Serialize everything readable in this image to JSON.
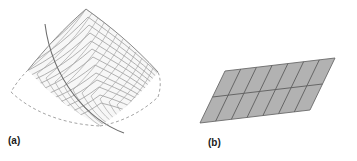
{
  "figure": {
    "background_color": "#ffffff",
    "panels": [
      {
        "id": "a",
        "caption": "(a)",
        "subject": "curved-ruled-surface-with-mesh",
        "description": "Warped quadrilateral surface patch shown in perspective, covered by a mesh of ruling lines with one darker curve crossing it",
        "surface_fill_color": "#f7f7f7",
        "mesh_line_color": "#9a9a9a",
        "boundary_line_color": "#8c8c8c",
        "highlight_curve_color": "#6e6e6e",
        "mesh_rows": 13,
        "mesh_columns": 13
      },
      {
        "id": "b",
        "caption": "(b)",
        "subject": "flat-parallelogram-grid",
        "description": "Planar parallelogram in perspective subdivided into a grid of rectangular cells",
        "surface_fill_color": "#b2b2b2",
        "grid_line_color": "#5d5d5d",
        "boundary_line_color": "#6a6a6a",
        "grid_columns": 7,
        "grid_rows": 2
      }
    ]
  }
}
